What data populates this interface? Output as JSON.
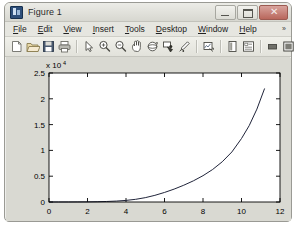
{
  "window": {
    "title": "Figure 1",
    "app_icon": "matlab-figure-icon",
    "caption": {
      "minimize_label": "–",
      "maximize_label": "□",
      "close_label": "✕"
    }
  },
  "menubar": {
    "items": [
      {
        "label": "File",
        "mnemonic": "F",
        "rest": "ile"
      },
      {
        "label": "Edit",
        "mnemonic": "E",
        "rest": "dit"
      },
      {
        "label": "View",
        "mnemonic": "V",
        "rest": "iew"
      },
      {
        "label": "Insert",
        "mnemonic": "I",
        "rest": "nsert"
      },
      {
        "label": "Tools",
        "mnemonic": "T",
        "rest": "ools"
      },
      {
        "label": "Desktop",
        "mnemonic": "D",
        "rest": "esktop"
      },
      {
        "label": "Window",
        "mnemonic": "W",
        "rest": "indow"
      },
      {
        "label": "Help",
        "mnemonic": "H",
        "rest": "elp"
      }
    ],
    "overflow_label": "»"
  },
  "toolbar": {
    "buttons": [
      {
        "name": "new-figure-icon",
        "tooltip": "New Figure"
      },
      {
        "name": "open-file-icon",
        "tooltip": "Open File"
      },
      {
        "name": "save-figure-icon",
        "tooltip": "Save Figure"
      },
      {
        "name": "print-figure-icon",
        "tooltip": "Print Figure"
      },
      {
        "name": "edit-plot-icon",
        "tooltip": "Edit Plot"
      },
      {
        "name": "zoom-in-icon",
        "tooltip": "Zoom In"
      },
      {
        "name": "zoom-out-icon",
        "tooltip": "Zoom Out"
      },
      {
        "name": "pan-icon",
        "tooltip": "Pan"
      },
      {
        "name": "rotate-3d-icon",
        "tooltip": "Rotate 3D"
      },
      {
        "name": "data-cursor-icon",
        "tooltip": "Data Cursor"
      },
      {
        "name": "brush-data-icon",
        "tooltip": "Brush/Select Data"
      },
      {
        "name": "link-plot-icon",
        "tooltip": "Link Plot"
      },
      {
        "name": "insert-colorbar-icon",
        "tooltip": "Insert Colorbar"
      },
      {
        "name": "insert-legend-icon",
        "tooltip": "Insert Legend"
      },
      {
        "name": "hide-plot-tools-icon",
        "tooltip": "Hide Plot Tools"
      },
      {
        "name": "show-plot-tools-icon",
        "tooltip": "Show Plot Tools and Dock Figure"
      }
    ]
  },
  "chart_data": {
    "type": "line",
    "title": "",
    "xlabel": "",
    "ylabel": "",
    "y_multiplier_prefix": "x 10",
    "y_multiplier_exponent": "4",
    "y_scale": 10000,
    "xlim": [
      0,
      12
    ],
    "ylim": [
      0,
      25000
    ],
    "xticks": [
      0,
      2,
      4,
      6,
      8,
      10,
      12
    ],
    "xticklabels": [
      "0",
      "2",
      "4",
      "6",
      "8",
      "10",
      "12"
    ],
    "yticks": [
      0,
      5000,
      10000,
      15000,
      20000,
      25000
    ],
    "yticklabels": [
      "0",
      "0.5",
      "1",
      "1.5",
      "2",
      "2.5"
    ],
    "grid": false,
    "legend": null,
    "line_color": "#20243a",
    "series": [
      {
        "name": "curve",
        "x": [
          0,
          0.5,
          1,
          1.5,
          2,
          2.5,
          3,
          3.5,
          4,
          4.5,
          5,
          5.5,
          6,
          6.5,
          7,
          7.5,
          8,
          8.5,
          9,
          9.5,
          10,
          10.4,
          10.8,
          11.2
        ],
        "y": [
          2,
          4,
          8,
          16,
          30,
          56,
          100,
          180,
          310,
          520,
          840,
          1290,
          1850,
          2500,
          3250,
          4100,
          5100,
          6300,
          7800,
          9700,
          12300,
          14800,
          18000,
          22000
        ]
      }
    ]
  }
}
